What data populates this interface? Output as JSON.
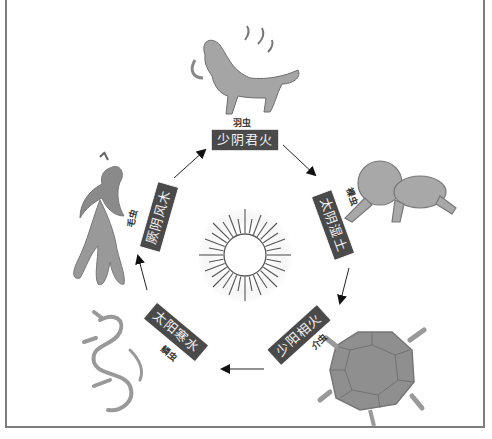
{
  "diagram": {
    "title": "",
    "center": {
      "icon": "sun-icon"
    },
    "nodes": [
      {
        "id": "shaoyin",
        "label": "少阴君火",
        "creature": "羽虫",
        "creature_icon": "qilin-icon"
      },
      {
        "id": "taiyin",
        "label": "太阴湿土",
        "creature": "裸虫",
        "creature_icon": "crawling-human-icon"
      },
      {
        "id": "shaoyang",
        "label": "少阳相火",
        "creature": "介虫",
        "creature_icon": "turtle-icon"
      },
      {
        "id": "taiyang",
        "label": "太阳寒水",
        "creature": "鳞虫",
        "creature_icon": "dragon-icon"
      },
      {
        "id": "jueyin",
        "label": "厥阴风木",
        "creature": "毛虫",
        "creature_icon": "phoenix-icon"
      }
    ],
    "flow": [
      "少阴君火 → 太阴湿土",
      "太阴湿土 → 少阳相火",
      "少阳相火 → 太阳寒水",
      "太阳寒水 → 厥阴风木",
      "厥阴风木 → 少阴君火"
    ],
    "colors": {
      "label_bg": "#4a4a4a",
      "label_text": "#f2f2f2",
      "frame": "#7d7d7d",
      "figure": "#8c8c8c"
    }
  }
}
